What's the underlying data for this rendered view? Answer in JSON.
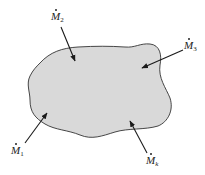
{
  "diagram": {
    "type": "control-volume",
    "region": {
      "fill": "#d9d9d9",
      "stroke": "#333333"
    },
    "arrow_color": "#1a1a1a",
    "flows": [
      {
        "id": "m1",
        "symbol": "M",
        "subscript": "1",
        "direction": "inward"
      },
      {
        "id": "m2",
        "symbol": "M",
        "subscript": "2",
        "direction": "inward"
      },
      {
        "id": "m3",
        "symbol": "M",
        "subscript": "3",
        "direction": "inward"
      },
      {
        "id": "mk",
        "symbol": "M",
        "subscript": "k",
        "direction": "inward"
      }
    ]
  }
}
